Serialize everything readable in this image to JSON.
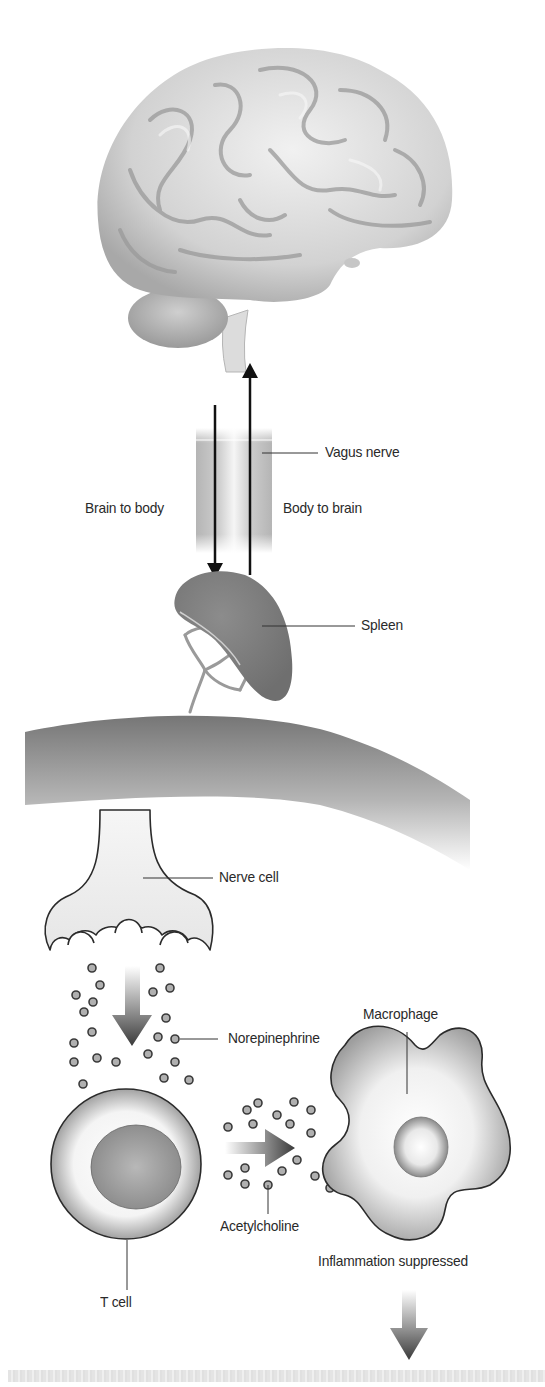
{
  "diagram": {
    "labels": {
      "vagus_nerve": "Vagus nerve",
      "brain_to_body": "Brain to body",
      "body_to_brain": "Body to brain",
      "spleen": "Spleen",
      "nerve_cell": "Nerve cell",
      "norepinephrine": "Norepinephrine",
      "macrophage": "Macrophage",
      "acetylcholine": "Acetylcholine",
      "inflammation_suppressed": "Inflammation suppressed",
      "t_cell": "T cell"
    },
    "arrows": [
      {
        "from": "brain",
        "to": "spleen",
        "direction": "down",
        "label": "Brain to body"
      },
      {
        "from": "spleen",
        "to": "brain",
        "direction": "up",
        "label": "Body to brain"
      },
      {
        "from": "nerve cell",
        "to": "T cell",
        "direction": "down",
        "style": "gradient"
      },
      {
        "from": "T cell",
        "to": "macrophage",
        "direction": "right",
        "style": "gradient"
      },
      {
        "from": "macrophage",
        "to": "outcome",
        "direction": "down",
        "style": "gradient"
      }
    ],
    "components": [
      "brain",
      "vagus nerve",
      "spleen",
      "spleen tissue",
      "nerve cell",
      "norepinephrine molecules",
      "T cell",
      "acetylcholine molecules",
      "macrophage"
    ],
    "colors": {
      "outline": "#2b2b2b",
      "tissue_gray": "#8a8a8a",
      "text": "#2a2a2a"
    }
  }
}
